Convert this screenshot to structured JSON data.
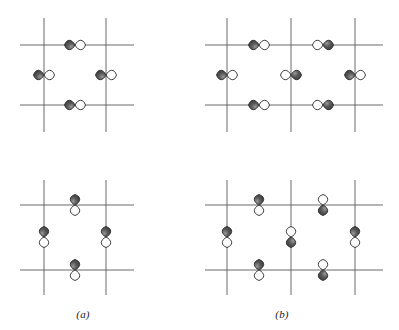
{
  "figure": {
    "width": 399,
    "height": 330,
    "background": "#ffffff",
    "grid_color": "#5a5a5a",
    "orbital_dark_color": "#3a3a3a",
    "orbital_light_color": "#ffffff",
    "orbital_outline_color": "#2a2a2a"
  },
  "captions": [
    {
      "id": "caption-a",
      "label": "(a)",
      "x": 63,
      "y": 308
    },
    {
      "id": "caption-b",
      "label": "(b)",
      "x": 262,
      "y": 308
    }
  ],
  "panels": [
    {
      "id": "panel-a-top",
      "name": "panel-a-top-left",
      "x": 10,
      "y": 8,
      "width": 140,
      "height": 130,
      "grid": {
        "vertical_lines": [
          34,
          96
        ],
        "horizontal_lines": [
          37,
          97
        ],
        "v_extent": [
          10,
          124
        ],
        "h_extent": [
          10,
          124
        ]
      },
      "orbitals": [
        {
          "id": "orb-a1",
          "cx": 65,
          "cy": 37,
          "orientation": "horizontal",
          "phase": "dark-left"
        },
        {
          "id": "orb-a2",
          "cx": 34,
          "cy": 67,
          "orientation": "horizontal",
          "phase": "dark-left"
        },
        {
          "id": "orb-a3",
          "cx": 96,
          "cy": 67,
          "orientation": "horizontal",
          "phase": "dark-left"
        },
        {
          "id": "orb-a4",
          "cx": 65,
          "cy": 97,
          "orientation": "horizontal",
          "phase": "dark-left"
        }
      ]
    },
    {
      "id": "panel-b-top",
      "name": "panel-b-top-right",
      "x": 205,
      "y": 8,
      "width": 190,
      "height": 130,
      "grid": {
        "vertical_lines": [
          22,
          86,
          150
        ],
        "horizontal_lines": [
          37,
          97
        ],
        "v_extent": [
          10,
          124
        ],
        "h_extent": [
          0,
          178
        ]
      },
      "orbitals": [
        {
          "id": "orb-b1",
          "cx": 54,
          "cy": 37,
          "orientation": "horizontal",
          "phase": "dark-left"
        },
        {
          "id": "orb-b2",
          "cx": 118,
          "cy": 37,
          "orientation": "horizontal",
          "phase": "dark-right"
        },
        {
          "id": "orb-b3",
          "cx": 22,
          "cy": 67,
          "orientation": "horizontal",
          "phase": "dark-left"
        },
        {
          "id": "orb-b4",
          "cx": 86,
          "cy": 67,
          "orientation": "horizontal",
          "phase": "dark-right"
        },
        {
          "id": "orb-b5",
          "cx": 150,
          "cy": 67,
          "orientation": "horizontal",
          "phase": "dark-left"
        },
        {
          "id": "orb-b6",
          "cx": 54,
          "cy": 97,
          "orientation": "horizontal",
          "phase": "dark-left"
        },
        {
          "id": "orb-b7",
          "cx": 118,
          "cy": 97,
          "orientation": "horizontal",
          "phase": "dark-right"
        }
      ]
    },
    {
      "id": "panel-a-bottom",
      "name": "panel-a-bottom-left",
      "x": 10,
      "y": 175,
      "width": 140,
      "height": 125,
      "grid": {
        "vertical_lines": [
          34,
          96
        ],
        "horizontal_lines": [
          30,
          95
        ],
        "v_extent": [
          5,
          120
        ],
        "h_extent": [
          10,
          124
        ]
      },
      "orbitals": [
        {
          "id": "orb-c1",
          "cx": 65,
          "cy": 30,
          "orientation": "vertical",
          "phase": "dark-top"
        },
        {
          "id": "orb-c2",
          "cx": 34,
          "cy": 62,
          "orientation": "vertical",
          "phase": "dark-top"
        },
        {
          "id": "orb-c3",
          "cx": 96,
          "cy": 62,
          "orientation": "vertical",
          "phase": "dark-top"
        },
        {
          "id": "orb-c4",
          "cx": 65,
          "cy": 95,
          "orientation": "vertical",
          "phase": "dark-top"
        }
      ]
    },
    {
      "id": "panel-b-bottom",
      "name": "panel-b-bottom-right",
      "x": 205,
      "y": 175,
      "width": 190,
      "height": 125,
      "grid": {
        "vertical_lines": [
          22,
          86,
          150
        ],
        "horizontal_lines": [
          30,
          95
        ],
        "v_extent": [
          5,
          120
        ],
        "h_extent": [
          0,
          178
        ]
      },
      "orbitals": [
        {
          "id": "orb-d1",
          "cx": 54,
          "cy": 30,
          "orientation": "vertical",
          "phase": "dark-top"
        },
        {
          "id": "orb-d2",
          "cx": 118,
          "cy": 30,
          "orientation": "vertical",
          "phase": "dark-bottom"
        },
        {
          "id": "orb-d3",
          "cx": 22,
          "cy": 62,
          "orientation": "vertical",
          "phase": "dark-top"
        },
        {
          "id": "orb-d4",
          "cx": 86,
          "cy": 62,
          "orientation": "vertical",
          "phase": "dark-bottom"
        },
        {
          "id": "orb-d5",
          "cx": 150,
          "cy": 62,
          "orientation": "vertical",
          "phase": "dark-top"
        },
        {
          "id": "orb-d6",
          "cx": 54,
          "cy": 95,
          "orientation": "vertical",
          "phase": "dark-top"
        },
        {
          "id": "orb-d7",
          "cx": 118,
          "cy": 95,
          "orientation": "vertical",
          "phase": "dark-bottom"
        }
      ]
    }
  ]
}
